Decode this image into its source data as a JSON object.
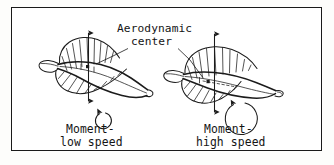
{
  "figure": {
    "kind": "aerodynamics-diagram",
    "border_color": "#1a1a1a",
    "ink_color": "#1b1b1b",
    "background_color": "#ffffff",
    "page_background_color": "#fdfdfb"
  },
  "annotation": {
    "label_line_1": "Aerodynamic",
    "label_line_2": "center",
    "marker_name": "aerodynamic-center-dot",
    "leader_count": 2
  },
  "panels": [
    {
      "id": "low-speed",
      "caption_line_1": "Moment-",
      "caption_line_2": "low speed",
      "moment_arc_size": "small",
      "moment_arc_direction": "counterclockwise",
      "force_arrow": "double-headed-vertical",
      "ac_position": "forward"
    },
    {
      "id": "high-speed",
      "caption_line_1": "Moment-",
      "caption_line_2": "high speed",
      "moment_arc_size": "large",
      "moment_arc_direction": "counterclockwise",
      "force_arrow": "double-headed-vertical",
      "ac_position": "aft"
    }
  ]
}
